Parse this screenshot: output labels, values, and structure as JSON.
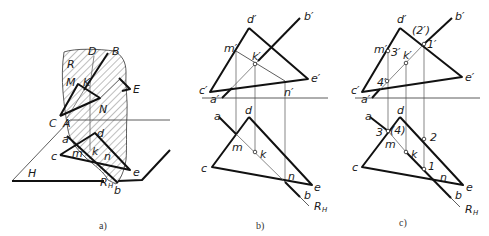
{
  "figure": {
    "panels": [
      {
        "id": "a",
        "caption": "a)",
        "labels": {
          "D": "D",
          "B": "B",
          "R": "R",
          "M": "M",
          "K": "K",
          "E": "E",
          "N": "N",
          "C": "C",
          "A": "A",
          "a": "a",
          "d": "d",
          "c": "c",
          "m": "m",
          "k": "k",
          "n": "n",
          "e": "e",
          "H": "H",
          "RH": "R",
          "RH_sub": "H",
          "b": "b"
        }
      },
      {
        "id": "b",
        "caption": "b)",
        "labels": {
          "d1": "d′",
          "b1": "b′",
          "m1": "m′",
          "k1": "k′",
          "e1": "e′",
          "c1": "c′",
          "a1": "a′",
          "n1": "n′",
          "a": "a",
          "d": "d",
          "m": "m",
          "k": "k",
          "c": "c",
          "n": "n",
          "e": "e",
          "b": "b",
          "RH": "R",
          "RH_sub": "H"
        }
      },
      {
        "id": "c",
        "caption": "c)",
        "labels": {
          "d1": "d′",
          "b1": "b′",
          "p2": "(2′)",
          "p1": "1′",
          "m1": "m′",
          "p3": "3′",
          "k1": "k′",
          "e1": "e′",
          "p4": "4′",
          "c1": "c′",
          "a1": "a′",
          "a": "a",
          "d": "d",
          "p3b": "3",
          "p4b": "(4)",
          "p2b": "2",
          "m": "m",
          "k": "k",
          "c": "c",
          "p1b": "1",
          "n": "n",
          "e": "e",
          "b": "b",
          "RH": "R",
          "RH_sub": "H"
        }
      }
    ]
  }
}
